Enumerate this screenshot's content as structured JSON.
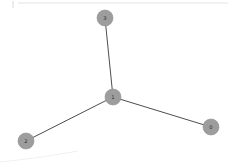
{
  "figure": {
    "title": "",
    "background_color": "#ffffff",
    "width": 232,
    "height": 168
  },
  "style": {
    "node_fill": "#9d9d9d",
    "node_stroke": "#8e8e8e",
    "node_radius": 8,
    "node_label_color": "#2b2b2b",
    "edge_color": "#4d4d4d",
    "edge_width": 1,
    "frame_line_color": "#e3e3e5",
    "frame_arc_color": "#f1f1f3"
  },
  "chart_data": {
    "type": "scatter",
    "title": "",
    "xlabel": "",
    "ylabel": "",
    "layout": "star",
    "graph": {
      "directed": false,
      "node_count": 4,
      "edge_count": 3,
      "nodes": [
        {
          "id": "3",
          "label": "3",
          "x": 105,
          "y": 18,
          "degree": 1
        },
        {
          "id": "1",
          "label": "1",
          "x": 113,
          "y": 97,
          "degree": 3
        },
        {
          "id": "2",
          "label": "2",
          "x": 26,
          "y": 141,
          "degree": 1
        },
        {
          "id": "0",
          "label": "0",
          "x": 211,
          "y": 127,
          "degree": 1
        }
      ],
      "edges": [
        {
          "source": "1",
          "target": "3",
          "x1": 113,
          "y1": 97,
          "x2": 105,
          "y2": 18
        },
        {
          "source": "1",
          "target": "2",
          "x1": 113,
          "y1": 97,
          "x2": 26,
          "y2": 141
        },
        {
          "source": "1",
          "target": "0",
          "x1": 113,
          "y1": 97,
          "x2": 211,
          "y2": 127
        }
      ]
    }
  },
  "frame": {
    "top_line": {
      "x1": 18,
      "y1": 3,
      "x2": 228,
      "y2": 3
    },
    "corner_stub": {
      "x1": 13,
      "y1": 1,
      "x2": 13,
      "y2": 8
    },
    "bottom_arc": "M 0 162 Q 40 158 78 151"
  }
}
